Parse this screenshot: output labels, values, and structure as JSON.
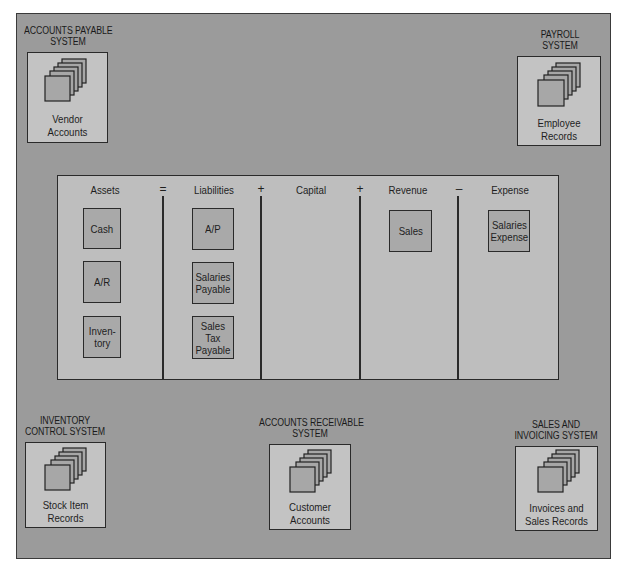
{
  "systems": [
    {
      "id": "accounts-payable",
      "title_line1": "ACCOUNTS PAYABLE",
      "title_line2": "SYSTEM",
      "file_line1": "Vendor",
      "file_line2": "Accounts"
    },
    {
      "id": "payroll",
      "title_line1": "PAYROLL",
      "title_line2": "SYSTEM",
      "file_line1": "Employee",
      "file_line2": "Records"
    },
    {
      "id": "inventory-control",
      "title_line1": "INVENTORY",
      "title_line2": "CONTROL SYSTEM",
      "file_line1": "Stock Item",
      "file_line2": "Records"
    },
    {
      "id": "accounts-receivable",
      "title_line1": "ACCOUNTS RECEIVABLE",
      "title_line2": "SYSTEM",
      "file_line1": "Customer",
      "file_line2": "Accounts"
    },
    {
      "id": "sales-invoicing",
      "title_line1": "SALES AND",
      "title_line2": "INVOICING SYSTEM",
      "file_line1": "Invoices and",
      "file_line2": "Sales Records"
    }
  ],
  "equation": {
    "columns": [
      {
        "heading": "Assets",
        "accounts": [
          "Cash",
          "A/R",
          "Inven-\ntory"
        ]
      },
      {
        "heading": "Liabilities",
        "accounts": [
          "A/P",
          "Salaries\nPayable",
          "Sales\nTax\nPayable"
        ]
      },
      {
        "heading": "Capital",
        "accounts": []
      },
      {
        "heading": "Revenue",
        "accounts": [
          "Sales"
        ]
      },
      {
        "heading": "Expense",
        "accounts": [
          "Salaries\nExpense"
        ]
      }
    ],
    "operators": [
      "=",
      "+",
      "+",
      "–"
    ]
  },
  "icons": {
    "file_stack": "stacked-records-icon"
  },
  "colors": {
    "panel": "#9b9b9b",
    "system_box": "#c3c3c3",
    "equation_panel": "#bebebe",
    "account_box": "#a9a9a9",
    "line": "#2a2a2a"
  }
}
